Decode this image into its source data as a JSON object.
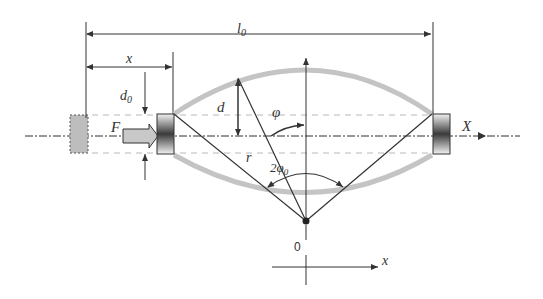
{
  "diagram": {
    "type": "mechanical-schematic",
    "labels": {
      "l0": "l",
      "l0_sub": "0",
      "x_dim": "x",
      "d0": "d",
      "d0_sub": "0",
      "d": "d",
      "F": "F",
      "phi": "φ",
      "r": "r",
      "two_phi0": "2φ",
      "two_phi0_sub": "0",
      "X_axis": "X",
      "origin": "0",
      "x_axis": "x"
    },
    "colors": {
      "line": "#333333",
      "arc": "#c4c4c4",
      "dashed": "#b8b8b8",
      "block_dark": "#3a3a3a",
      "block_light": "#f0f0f0",
      "arrow_fill": "#c8c8c8",
      "ghost_block": "#bdbdbd"
    }
  }
}
